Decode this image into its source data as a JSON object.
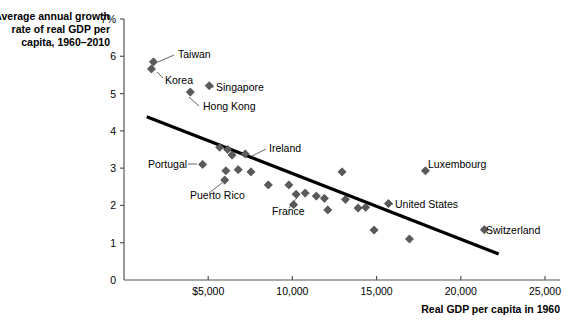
{
  "chart_data": {
    "type": "scatter",
    "title": "",
    "ylabel": "Average annual growth rate of real GDP per capita, 1960–2010",
    "ylabel_lines": [
      "Average annual growth",
      "rate of real GDP per",
      "capita, 1960–2010"
    ],
    "xlabel": "Real GDP per capita in 1960",
    "xlim": [
      0,
      25600
    ],
    "ylim": [
      0,
      7
    ],
    "xticks": [
      5000,
      10000,
      15000,
      20000,
      25000
    ],
    "xticklabels": [
      "$5,000",
      "10,000",
      "15,000",
      "20,000",
      "25,000"
    ],
    "yticks": [
      0,
      1,
      2,
      3,
      4,
      5,
      6,
      7
    ],
    "yticklabels": [
      "0",
      "1",
      "2",
      "3",
      "4",
      "5",
      "6",
      "7%"
    ],
    "grid": false,
    "legend": false,
    "marker": "diamond",
    "marker_color": "#5a5a5a",
    "trendline": {
      "label": "",
      "color": "#000000",
      "width": 3.2,
      "x0": 1350,
      "y0": 4.38,
      "x1": 22250,
      "y1": 0.7
    },
    "points": [
      {
        "label": "Taiwan",
        "x": 1750,
        "y": 5.85,
        "labeled": true
      },
      {
        "label": "Korea",
        "x": 1630,
        "y": 5.66,
        "labeled": true
      },
      {
        "label": "Singapore",
        "x": 5060,
        "y": 5.21,
        "labeled": true
      },
      {
        "label": "Hong Kong",
        "x": 3940,
        "y": 5.04,
        "labeled": true
      },
      {
        "label": "Portugal",
        "x": 4670,
        "y": 3.1,
        "labeled": true
      },
      {
        "label": "Ireland",
        "x": 6420,
        "y": 3.35,
        "labeled": true
      },
      {
        "label": "Puerto Rico",
        "x": 5980,
        "y": 2.68,
        "labeled": true
      },
      {
        "label": "France",
        "x": 10760,
        "y": 2.33,
        "labeled": true
      },
      {
        "label": "Luxembourg",
        "x": 17900,
        "y": 2.93,
        "labeled": true
      },
      {
        "label": "United States",
        "x": 15700,
        "y": 2.05,
        "labeled": true
      },
      {
        "label": "Switzerland",
        "x": 21400,
        "y": 1.35,
        "labeled": true
      },
      {
        "label": "",
        "x": 5680,
        "y": 3.56,
        "labeled": false
      },
      {
        "label": "",
        "x": 6160,
        "y": 3.5,
        "labeled": false
      },
      {
        "label": "",
        "x": 7200,
        "y": 3.38,
        "labeled": false
      },
      {
        "label": "",
        "x": 6050,
        "y": 2.93,
        "labeled": false
      },
      {
        "label": "",
        "x": 6780,
        "y": 2.96,
        "labeled": false
      },
      {
        "label": "",
        "x": 7540,
        "y": 2.9,
        "labeled": false
      },
      {
        "label": "",
        "x": 8570,
        "y": 2.55,
        "labeled": false
      },
      {
        "label": "",
        "x": 9790,
        "y": 2.55,
        "labeled": false
      },
      {
        "label": "",
        "x": 10220,
        "y": 2.3,
        "labeled": false
      },
      {
        "label": "",
        "x": 10070,
        "y": 2.02,
        "labeled": false
      },
      {
        "label": "",
        "x": 11420,
        "y": 2.25,
        "labeled": false
      },
      {
        "label": "",
        "x": 11900,
        "y": 2.19,
        "labeled": false
      },
      {
        "label": "",
        "x": 12100,
        "y": 1.88,
        "labeled": false
      },
      {
        "label": "",
        "x": 12950,
        "y": 2.9,
        "labeled": false
      },
      {
        "label": "",
        "x": 13150,
        "y": 2.16,
        "labeled": false
      },
      {
        "label": "",
        "x": 13900,
        "y": 1.93,
        "labeled": false
      },
      {
        "label": "",
        "x": 14350,
        "y": 1.95,
        "labeled": false
      },
      {
        "label": "",
        "x": 14850,
        "y": 1.34,
        "labeled": false
      },
      {
        "label": "",
        "x": 16950,
        "y": 1.1,
        "labeled": false
      }
    ],
    "annotations": [
      {
        "text": "Taiwan",
        "tx": 178,
        "ty": 58,
        "lx0": 158,
        "ly0": 62,
        "lx1": 174,
        "ly1": 55
      },
      {
        "text": "Korea",
        "tx": 165,
        "ty": 84,
        "lx0": 157,
        "ly0": 72,
        "lx1": 163,
        "ly1": 78
      },
      {
        "text": "Singapore",
        "tx": 216,
        "ty": 91,
        "lx0": 210,
        "ly0": 87,
        "lx1": 214,
        "ly1": 87
      },
      {
        "text": "Hong Kong",
        "tx": 203,
        "ty": 110,
        "lx0": 189,
        "ly0": 97,
        "lx1": 199,
        "ly1": 106
      },
      {
        "text": "Portugal",
        "tx": 148,
        "ty": 168,
        "lx0": 188,
        "ly0": 164,
        "lx1": 197,
        "ly1": 164
      },
      {
        "text": "Ireland",
        "tx": 269,
        "ty": 152,
        "lx0": 252,
        "ly0": 156,
        "lx1": 266,
        "ly1": 149
      },
      {
        "text": "Puerto Rico",
        "tx": 190,
        "ty": 199,
        "lx0": 222,
        "ly0": 183,
        "lx1": 209,
        "ly1": 193
      },
      {
        "text": "France",
        "tx": 272,
        "ty": 215,
        "lx0": 300,
        "ly0": 194,
        "lx1": 289,
        "ly1": 208
      },
      {
        "text": "Luxembourg",
        "tx": 428,
        "ty": 168,
        "lx0": null,
        "ly0": null,
        "lx1": null,
        "ly1": null
      },
      {
        "text": "United States",
        "tx": 395,
        "ty": 208,
        "lx0": 387,
        "ly0": 204,
        "lx1": 393,
        "ly1": 204
      },
      {
        "text": "Switzerland",
        "tx": 486,
        "ty": 234,
        "lx0": null,
        "ly0": null,
        "lx1": null,
        "ly1": null
      }
    ]
  }
}
